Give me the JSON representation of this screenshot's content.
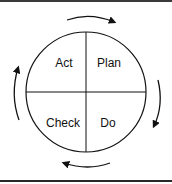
{
  "diagram": {
    "type": "cycle",
    "quadrants": [
      {
        "position": "top-left",
        "label": "Act"
      },
      {
        "position": "top-right",
        "label": "Plan"
      },
      {
        "position": "bottom-right",
        "label": "Do"
      },
      {
        "position": "bottom-left",
        "label": "Check"
      }
    ],
    "arrows": [
      "clockwise-top",
      "clockwise-right",
      "clockwise-bottom",
      "clockwise-left"
    ],
    "colors": {
      "stroke": "#111111",
      "background": "#ffffff"
    }
  }
}
